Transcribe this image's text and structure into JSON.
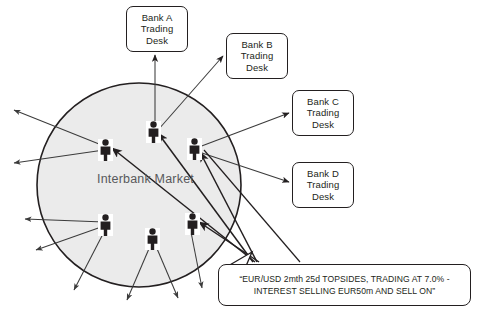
{
  "diagram": {
    "title_label": "Interbank Market",
    "market_circle": {
      "name": "interbank-market-circle",
      "fill_color": "#ebebeb",
      "stroke_color": "#231f20",
      "cx": 139,
      "cy": 185,
      "r": 102
    },
    "bank_desks": [
      {
        "id": "bank-a",
        "lines": [
          "Bank A",
          "Trading",
          "Desk"
        ],
        "x": 126,
        "y": 6,
        "w": 62,
        "h": 46
      },
      {
        "id": "bank-b",
        "lines": [
          "Bank B",
          "Trading",
          "Desk"
        ],
        "x": 226,
        "y": 33,
        "w": 62,
        "h": 46
      },
      {
        "id": "bank-c",
        "lines": [
          "Bank C",
          "Trading",
          "Desk"
        ],
        "x": 292,
        "y": 90,
        "w": 62,
        "h": 46
      },
      {
        "id": "bank-d",
        "lines": [
          "Bank D",
          "Trading",
          "Desk"
        ],
        "x": 292,
        "y": 162,
        "w": 62,
        "h": 46
      }
    ],
    "traders": [
      {
        "id": "trader-top-center",
        "x": 149,
        "y": 125
      },
      {
        "id": "trader-left-upper",
        "x": 105,
        "y": 143
      },
      {
        "id": "trader-right-upper",
        "x": 194,
        "y": 142
      },
      {
        "id": "trader-left-lower",
        "x": 105,
        "y": 218
      },
      {
        "id": "trader-bottom-center",
        "x": 152,
        "y": 232
      },
      {
        "id": "trader-right-lower",
        "x": 192,
        "y": 217
      }
    ],
    "quote_callout": {
      "line1": "“EUR/USD 2mth 25d TOPSIDES, TRADING AT 7.0% -",
      "line2": "INTEREST SELLING EUR50m AND SELL ON”",
      "x": 218,
      "y": 264,
      "w": 253,
      "h": 42
    },
    "colors": {
      "ink": "#231f20",
      "circle_fill": "#ebebeb",
      "label_gray": "#58595b",
      "arrow": "#3b3b3b",
      "background": "#ffffff"
    }
  }
}
